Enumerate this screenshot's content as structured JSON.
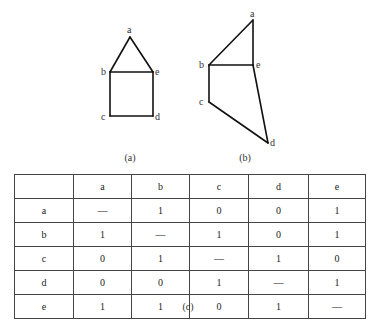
{
  "figures": {
    "a": {
      "caption": "(a)",
      "nodes": [
        {
          "id": "a",
          "label": "a",
          "x": 130,
          "y": 37,
          "lx": 127,
          "ly": 33
        },
        {
          "id": "b",
          "label": "b",
          "x": 110,
          "y": 72,
          "lx": 101,
          "ly": 75
        },
        {
          "id": "e",
          "label": "e",
          "x": 153,
          "y": 72,
          "lx": 155,
          "ly": 75
        },
        {
          "id": "c",
          "label": "c",
          "x": 110,
          "y": 116,
          "lx": 101,
          "ly": 120
        },
        {
          "id": "d",
          "label": "d",
          "x": 153,
          "y": 116,
          "lx": 155,
          "ly": 120
        }
      ],
      "edges": [
        [
          "a",
          "b"
        ],
        [
          "a",
          "e"
        ],
        [
          "b",
          "e"
        ],
        [
          "b",
          "c"
        ],
        [
          "e",
          "d"
        ],
        [
          "c",
          "d"
        ]
      ]
    },
    "b": {
      "caption": "(b)",
      "nodes": [
        {
          "id": "a",
          "label": "a",
          "x": 253,
          "y": 20,
          "lx": 250,
          "ly": 17
        },
        {
          "id": "b",
          "label": "b",
          "x": 209,
          "y": 65,
          "lx": 199,
          "ly": 68
        },
        {
          "id": "e",
          "label": "e",
          "x": 253,
          "y": 65,
          "lx": 256,
          "ly": 68
        },
        {
          "id": "c",
          "label": "c",
          "x": 209,
          "y": 102,
          "lx": 199,
          "ly": 105
        },
        {
          "id": "d",
          "label": "d",
          "x": 268,
          "y": 143,
          "lx": 270,
          "ly": 146
        }
      ],
      "edges": [
        [
          "a",
          "b"
        ],
        [
          "a",
          "e"
        ],
        [
          "b",
          "e"
        ],
        [
          "b",
          "c"
        ],
        [
          "e",
          "d"
        ],
        [
          "c",
          "d"
        ]
      ]
    }
  },
  "table": {
    "caption": "(c)",
    "corner": "",
    "columns": [
      "a",
      "b",
      "c",
      "d",
      "e"
    ],
    "rows": [
      {
        "label": "a",
        "cells": [
          "—",
          "1",
          "0",
          "0",
          "1"
        ]
      },
      {
        "label": "b",
        "cells": [
          "1",
          "—",
          "1",
          "0",
          "1"
        ]
      },
      {
        "label": "c",
        "cells": [
          "0",
          "1",
          "—",
          "1",
          "0"
        ]
      },
      {
        "label": "d",
        "cells": [
          "0",
          "0",
          "1",
          "—",
          "1"
        ]
      },
      {
        "label": "e",
        "cells": [
          "1",
          "1",
          "0",
          "1",
          "—"
        ]
      }
    ]
  },
  "colors": {
    "line": "#111111",
    "text": "#333333",
    "background": "#ffffff"
  }
}
